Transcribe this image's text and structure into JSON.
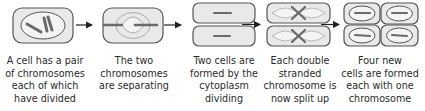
{
  "diagram": {
    "colors": {
      "cell_fill": "#e9e9e9",
      "cell_outline": "#555555",
      "nucleus_fill": "#f4f4f4",
      "chromosome": "#6a6a6a",
      "arrow": "#222222"
    },
    "stages": [
      {
        "id": 1,
        "caption": "A cell has a pair\nof chromosomes\neach of which\nhave divided"
      },
      {
        "id": 2,
        "caption": "The two\nchromosomes\nare separating"
      },
      {
        "id": 3,
        "caption": "Two cells are\nformed by the\ncytoplasm\ndividing"
      },
      {
        "id": 4,
        "caption": "Each double\nstranded\nchromosome is\nnow split up"
      },
      {
        "id": 5,
        "caption": "Four new\ncells are formed\neach with one\nchromosome"
      }
    ],
    "arrows": [
      {
        "from": 1,
        "to": 2,
        "icon": "right-arrow-icon"
      },
      {
        "from": 2,
        "to": 3,
        "icon": "right-arrow-icon"
      },
      {
        "from": 3,
        "to": 4,
        "icon": "right-arrow-icon"
      },
      {
        "from": 4,
        "to": 5,
        "icon": "right-arrow-icon"
      }
    ]
  }
}
